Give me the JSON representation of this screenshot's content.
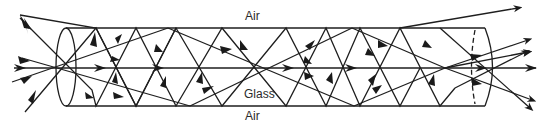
{
  "diagram": {
    "labels": {
      "air_top": "Air",
      "glass": "Glass",
      "air_bottom": "Air"
    },
    "colors": {
      "stroke": "#1e1e1e",
      "background": "#ffffff",
      "text": "#2a2a2a"
    },
    "elements": {
      "fiber_tube": "cylinder",
      "entry_face": "ellipse",
      "exit_face": "half-ellipse with dashed back edge",
      "rays": "multiple rays reflecting zig-zag between top and bottom surfaces"
    }
  }
}
